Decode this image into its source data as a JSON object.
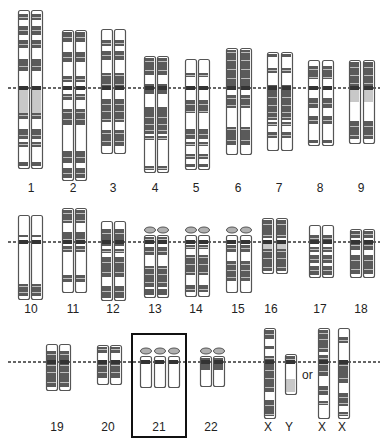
{
  "colors": {
    "outline": "#555555",
    "dark_band": "#5a5a5a",
    "light_band": "#ffffff",
    "pale_band": "#c8c8c8",
    "satellite": "#b0b0b0",
    "dashed_line": "#333333",
    "highlight_box": "#111111"
  },
  "rows": [
    {
      "centromere_line_y": 88,
      "label_y": 181,
      "groups": [
        {
          "label": "1",
          "label_x": 31,
          "count": 2,
          "x": [
            18,
            31
          ],
          "top": 10,
          "bottom": 168,
          "pale": [
            0.48,
            0.6
          ]
        },
        {
          "label": "2",
          "label_x": 73,
          "count": 2,
          "x": [
            62,
            75
          ],
          "top": 30,
          "bottom": 180
        },
        {
          "label": "3",
          "label_x": 113,
          "count": 2,
          "x": [
            101,
            114
          ],
          "top": 29,
          "bottom": 153
        },
        {
          "label": "4",
          "label_x": 155,
          "count": 2,
          "x": [
            144,
            157
          ],
          "top": 56,
          "bottom": 172
        },
        {
          "label": "5",
          "label_x": 196,
          "count": 2,
          "x": [
            185,
            198
          ],
          "top": 59,
          "bottom": 169
        },
        {
          "label": "6",
          "label_x": 238,
          "count": 2,
          "x": [
            226,
            240
          ],
          "top": 48,
          "bottom": 154
        },
        {
          "label": "7",
          "label_x": 279,
          "count": 2,
          "x": [
            267,
            281
          ],
          "top": 52,
          "bottom": 150
        },
        {
          "label": "8",
          "label_x": 320,
          "count": 2,
          "x": [
            308,
            322
          ],
          "top": 60,
          "bottom": 145
        },
        {
          "label": "9",
          "label_x": 361,
          "count": 2,
          "x": [
            349,
            363
          ],
          "top": 60,
          "bottom": 143,
          "pale": [
            0.33,
            0.48
          ]
        }
      ]
    },
    {
      "centromere_line_y": 242,
      "label_y": 302,
      "groups": [
        {
          "label": "10",
          "label_x": 31,
          "count": 2,
          "x": [
            18,
            31
          ],
          "top": 215,
          "bottom": 299
        },
        {
          "label": "11",
          "label_x": 73,
          "count": 2,
          "x": [
            62,
            75
          ],
          "top": 208,
          "bottom": 292
        },
        {
          "label": "12",
          "label_x": 113,
          "count": 2,
          "x": [
            101,
            114
          ],
          "top": 221,
          "bottom": 300
        },
        {
          "label": "13",
          "label_x": 155,
          "count": 2,
          "x": [
            144,
            157
          ],
          "top": 235,
          "bottom": 297,
          "satellite": true
        },
        {
          "label": "14",
          "label_x": 196,
          "count": 2,
          "x": [
            185,
            198
          ],
          "top": 235,
          "bottom": 296,
          "satellite": true
        },
        {
          "label": "15",
          "label_x": 238,
          "count": 2,
          "x": [
            226,
            240
          ],
          "top": 235,
          "bottom": 292,
          "satellite": true
        },
        {
          "label": "16",
          "label_x": 271,
          "count": 2,
          "x": [
            262,
            276
          ],
          "top": 218,
          "bottom": 273,
          "pale": [
            0.4,
            0.55
          ]
        },
        {
          "label": "17",
          "label_x": 320,
          "count": 2,
          "x": [
            309,
            322
          ],
          "top": 225,
          "bottom": 277
        },
        {
          "label": "18",
          "label_x": 361,
          "count": 2,
          "x": [
            350,
            363
          ],
          "top": 229,
          "bottom": 277
        }
      ]
    },
    {
      "centromere_line_y": 362,
      "label_y": 420,
      "groups": [
        {
          "label": "19",
          "label_x": 57,
          "count": 2,
          "x": [
            46,
            59
          ],
          "top": 344,
          "bottom": 390
        },
        {
          "label": "20",
          "label_x": 108,
          "count": 2,
          "x": [
            97,
            110
          ],
          "top": 345,
          "bottom": 384
        },
        {
          "label": "21",
          "label_x": 159,
          "count": 3,
          "x": [
            140,
            154,
            168
          ],
          "top": 356,
          "bottom": 387,
          "satellite": true,
          "highlighted": true,
          "lower_white": 0.45
        },
        {
          "label": "22",
          "label_x": 211,
          "count": 2,
          "x": [
            200,
            213
          ],
          "top": 356,
          "bottom": 386,
          "satellite": true,
          "lower_white": 0.45
        },
        {
          "label": "X",
          "label_x": 268,
          "count": 1,
          "x": [
            264
          ],
          "top": 328,
          "bottom": 418
        },
        {
          "label": "Y",
          "label_x": 289,
          "count": 1,
          "x": [
            285
          ],
          "top": 354,
          "bottom": 394,
          "y_chrom": true
        },
        {
          "label": "X",
          "label_x": 322,
          "count": 1,
          "x": [
            318
          ],
          "top": 328,
          "bottom": 418
        },
        {
          "label": "X",
          "label_x": 342,
          "count": 1,
          "x": [
            338
          ],
          "top": 328,
          "bottom": 418
        }
      ]
    }
  ],
  "or_text": "or",
  "or_position": {
    "x": 302,
    "y": 368
  },
  "highlight_box": {
    "x": 131,
    "y": 333,
    "width": 56,
    "height": 105
  }
}
